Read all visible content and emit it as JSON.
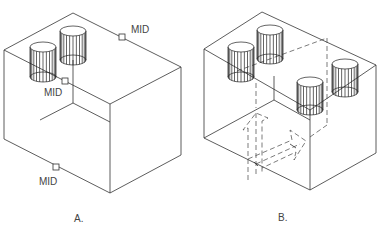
{
  "figure": {
    "panels": [
      {
        "id": "A",
        "caption": "A.",
        "object": "rectangular block with two cylinders on top",
        "snap_markers": [
          {
            "label": "MID"
          },
          {
            "label": "MID"
          },
          {
            "label": "MID"
          }
        ]
      },
      {
        "id": "B",
        "caption": "B.",
        "object": "block split into two halves with four cylinders; dashed arrows indicate copy/move",
        "arrows": [
          "up-arrow",
          "right-arrow"
        ]
      }
    ]
  }
}
